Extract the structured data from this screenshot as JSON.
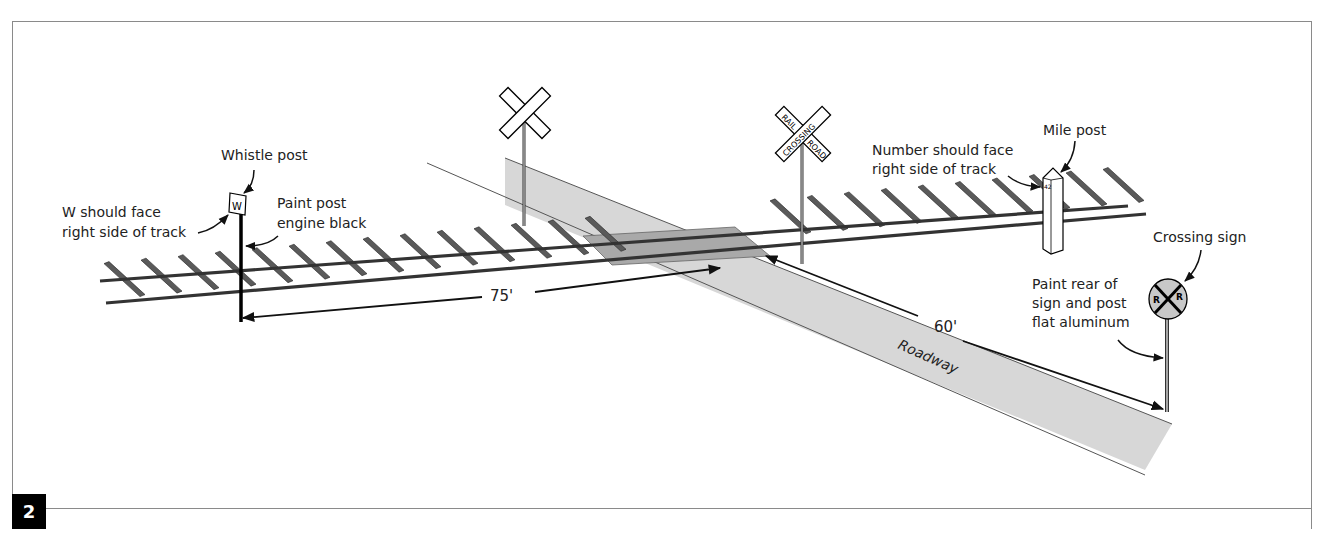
{
  "figure": {
    "number": "2",
    "badge_bg": "#000000",
    "badge_fg": "#ffffff",
    "frame_color": "#8a8a8a"
  },
  "labels": {
    "whistle_post": "Whistle post",
    "w_face_line1": "W should face",
    "w_face_line2": "right side of track",
    "paint_post_line1": "Paint post",
    "paint_post_line2": "engine black",
    "number_face_line1": "Number should face",
    "number_face_line2": "right side of track",
    "mile_post": "Mile post",
    "crossing_sign": "Crossing sign",
    "paint_rear_line1": "Paint rear of",
    "paint_rear_line2": "sign and post",
    "paint_rear_line3": "flat aluminum",
    "roadway": "Roadway"
  },
  "signs": {
    "whistle_letter": "W",
    "crossbuck_words": [
      "RAIL",
      "ROAD",
      "CROSSING"
    ],
    "mile_number": "42",
    "advance_letters": [
      "R",
      "R"
    ]
  },
  "dimensions": {
    "whistle_to_crossing": "75'",
    "crossing_to_sign": "60'"
  },
  "colors": {
    "roadway_fill": "#d8d8d8",
    "crossing_pad": "#b5b5b5",
    "rail": "#3a3a3a",
    "tie": "#555555",
    "sign_fill": "#c8c8c8"
  }
}
